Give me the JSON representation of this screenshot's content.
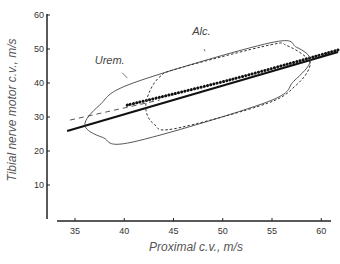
{
  "chart_data": {
    "type": "line",
    "title": "",
    "xlabel": "Proximal c.v., m/s",
    "ylabel": "Tibial nerve  motor c.v., m/s",
    "xlim": [
      34,
      62
    ],
    "ylim": [
      0,
      60
    ],
    "xticks": [
      35,
      40,
      45,
      50,
      55,
      60
    ],
    "yticks": [
      10,
      20,
      30,
      40,
      50,
      60
    ],
    "xtick_labels": [
      "35",
      "40",
      "45",
      "50",
      "55",
      "60"
    ],
    "ytick_labels": [
      "10",
      "20",
      "30",
      "40",
      "50",
      "60"
    ],
    "grid": false,
    "legend": "none",
    "series": [
      {
        "name": "Regression (all)",
        "style": "solid-thick",
        "points": [
          [
            34.2,
            25.9
          ],
          [
            61.7,
            49.1
          ]
        ]
      },
      {
        "name": "Urem. regression",
        "style": "dashed",
        "points": [
          [
            34.5,
            29.1
          ],
          [
            43.6,
            35.0
          ]
        ]
      },
      {
        "name": "Alc. regression",
        "style": "dotted",
        "points": [
          [
            40.3,
            33.5
          ],
          [
            50.7,
            40.9
          ],
          [
            61.7,
            49.7
          ]
        ]
      },
      {
        "name": "Urem. envelope",
        "style": "solid-thin",
        "closed": true,
        "points": [
          [
            36.0,
            27.6
          ],
          [
            37.5,
            33.5
          ],
          [
            40.9,
            40.0
          ],
          [
            54.8,
            51.8
          ],
          [
            57.5,
            50.5
          ],
          [
            58.9,
            46.5
          ],
          [
            57.2,
            40.5
          ],
          [
            54.5,
            34.4
          ],
          [
            40.8,
            22.6
          ],
          [
            37.8,
            24.0
          ],
          [
            36.0,
            27.6
          ]
        ]
      },
      {
        "name": "Alc. envelope",
        "style": "dashed-thin",
        "closed": true,
        "points": [
          [
            42.2,
            32.0
          ],
          [
            42.5,
            37.0
          ],
          [
            43.6,
            41.8
          ],
          [
            45.5,
            44.3
          ],
          [
            54.8,
            51.2
          ],
          [
            56.5,
            51.0
          ],
          [
            58.5,
            47.5
          ],
          [
            58.8,
            44.5
          ],
          [
            57.5,
            39.5
          ],
          [
            54.5,
            34.0
          ],
          [
            45.0,
            26.5
          ],
          [
            43.0,
            28.0
          ],
          [
            42.2,
            32.0
          ]
        ]
      }
    ],
    "annotations": [
      {
        "text": "Urem.",
        "x": 37.0,
        "y": 45.5,
        "pointer": [
          [
            39.8,
            43.0
          ],
          [
            40.3,
            41.5
          ]
        ]
      },
      {
        "text": "Alc.",
        "x": 46.9,
        "y": 54.0,
        "pointer": [
          [
            48.1,
            50.0
          ],
          [
            48.2,
            49.3
          ]
        ]
      }
    ]
  }
}
